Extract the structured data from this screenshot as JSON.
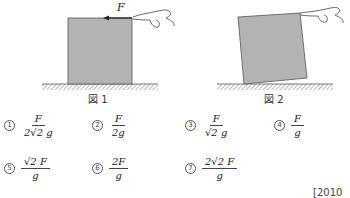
{
  "figure1": {
    "caption": "図 1",
    "force_label": "F",
    "description": "Gray block resting on hatched ground; hand pulls top-right corner leftward with force F"
  },
  "figure2": {
    "caption": "図 2",
    "description": "Gray block tilted, pivoting on bottom-left corner, hand lifting top-right corner"
  },
  "options": [
    {
      "num": "1",
      "numerator": "F",
      "denominator": "2√2 g"
    },
    {
      "num": "2",
      "numerator": "F",
      "denominator": "2g"
    },
    {
      "num": "3",
      "numerator": "F",
      "denominator": "√2 g"
    },
    {
      "num": "4",
      "numerator": "F",
      "denominator": "g"
    },
    {
      "num": "5",
      "numerator": "√2 F",
      "denominator": "g"
    },
    {
      "num": "6",
      "numerator": "2F",
      "denominator": "g"
    },
    {
      "num": "7",
      "numerator": "2√2 F",
      "denominator": "g"
    }
  ],
  "source": "[2010 年"
}
